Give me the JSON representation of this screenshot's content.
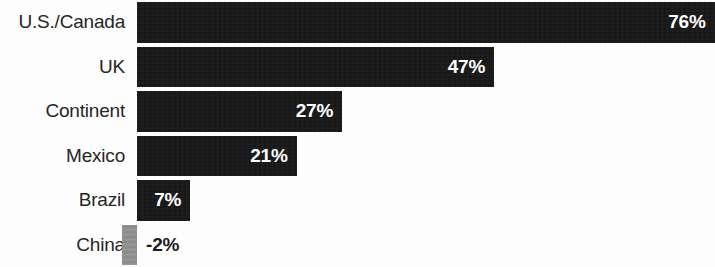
{
  "chart_data": {
    "type": "bar",
    "orientation": "horizontal",
    "title": "",
    "subtitle": "",
    "xlabel": "",
    "ylabel": "",
    "grid": false,
    "legend": null,
    "axis_baseline_percent": 0,
    "xlim": [
      -2,
      76
    ],
    "value_suffix": "%",
    "categories": [
      "U.S./Canada",
      "UK",
      "Continent",
      "Mexico",
      "Brazil",
      "China"
    ],
    "values": [
      76,
      47,
      27,
      21,
      7,
      -2
    ],
    "labels": [
      "76%",
      "47%",
      "27%",
      "21%",
      "7%",
      "-2%"
    ],
    "colors": {
      "positive_bar": "#141414",
      "negative_bar": "#8e8e8e",
      "label_on_bar": "#ffffff",
      "label_off_bar": "#1a1a1a",
      "category_text": "#262626",
      "background": "#fdfdfd"
    },
    "bars": [
      {
        "category": "U.S./Canada",
        "value": 76,
        "label": "76%",
        "negative": false,
        "label_inside": true
      },
      {
        "category": "UK",
        "value": 47,
        "label": "47%",
        "negative": false,
        "label_inside": true
      },
      {
        "category": "Continent",
        "value": 27,
        "label": "27%",
        "negative": false,
        "label_inside": true
      },
      {
        "category": "Mexico",
        "value": 21,
        "label": "21%",
        "negative": false,
        "label_inside": true
      },
      {
        "category": "Brazil",
        "value": 7,
        "label": "7%",
        "negative": false,
        "label_inside": true
      },
      {
        "category": "China",
        "value": -2,
        "label": "-2%",
        "negative": true,
        "label_inside": false
      }
    ]
  },
  "layout": {
    "baseline_x": 137,
    "px_per_percent": 7.6,
    "label_column_width": 125
  }
}
